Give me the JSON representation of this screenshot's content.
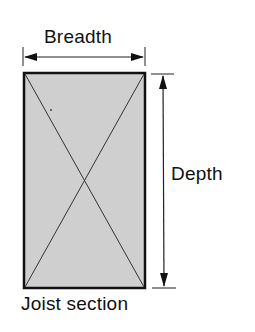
{
  "diagram": {
    "title": "Joist section",
    "labels": {
      "breadth": "Breadth",
      "depth": "Depth",
      "caption": "Joist section"
    },
    "section": {
      "x": 23,
      "y": 73,
      "width": 122,
      "height": 216,
      "fill": "#cfcfcf",
      "stroke": "#111111",
      "diagonals": true
    },
    "dimensions": [
      {
        "name": "breadth",
        "orientation": "horizontal",
        "from": 23,
        "to": 145,
        "at": 57
      },
      {
        "name": "depth",
        "orientation": "vertical",
        "from": 74,
        "to": 288,
        "at": 163
      }
    ],
    "colors": {
      "line": "#111111",
      "fill": "#cfcfcf",
      "background": "#ffffff"
    }
  }
}
